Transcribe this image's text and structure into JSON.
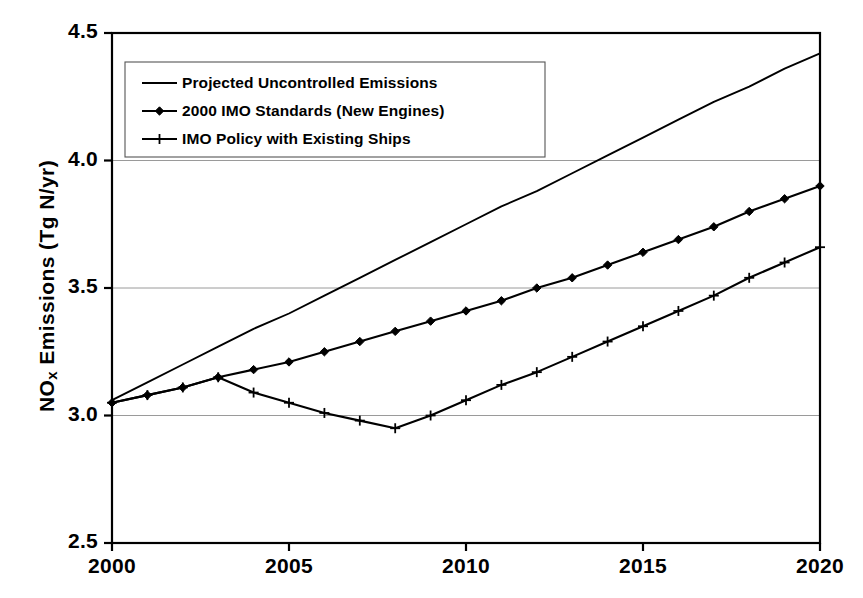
{
  "chart_data": {
    "type": "line",
    "title": "",
    "xlabel": "",
    "ylabel": "NOx Emissions (Tg N/yr)",
    "ylabel_main": "NO",
    "ylabel_sub": "x",
    "ylabel_rest": " Emissions (Tg N/yr)",
    "xlim": [
      2000,
      2020
    ],
    "ylim": [
      2.5,
      4.5
    ],
    "grid": true,
    "grid_axis": "y",
    "legend_position": "top-left-inside",
    "xticks": [
      "2000",
      "2005",
      "2010",
      "2015",
      "2020"
    ],
    "xtick_values": [
      2000,
      2005,
      2010,
      2015,
      2020
    ],
    "yticks": [
      "2.5",
      "3.0",
      "3.5",
      "4.0",
      "4.5"
    ],
    "ytick_values": [
      2.5,
      3.0,
      3.5,
      4.0,
      4.5
    ],
    "x": [
      2000,
      2001,
      2002,
      2003,
      2004,
      2005,
      2006,
      2007,
      2008,
      2009,
      2010,
      2011,
      2012,
      2013,
      2014,
      2015,
      2016,
      2017,
      2018,
      2019,
      2020
    ],
    "series": [
      {
        "name": "Projected Uncontrolled Emissions",
        "marker": "none",
        "color": "#000000",
        "values": [
          3.06,
          3.13,
          3.2,
          3.27,
          3.34,
          3.4,
          3.47,
          3.54,
          3.61,
          3.68,
          3.75,
          3.82,
          3.88,
          3.95,
          4.02,
          4.09,
          4.16,
          4.23,
          4.29,
          4.36,
          4.42
        ]
      },
      {
        "name": "2000 IMO Standards (New Engines)",
        "marker": "diamond",
        "color": "#000000",
        "values": [
          3.05,
          3.08,
          3.11,
          3.15,
          3.18,
          3.21,
          3.25,
          3.29,
          3.33,
          3.37,
          3.41,
          3.45,
          3.5,
          3.54,
          3.59,
          3.64,
          3.69,
          3.74,
          3.8,
          3.85,
          3.9
        ]
      },
      {
        "name": "IMO Policy with Existing Ships",
        "marker": "plus",
        "color": "#000000",
        "values": [
          3.05,
          3.08,
          3.11,
          3.15,
          3.09,
          3.05,
          3.01,
          2.98,
          2.95,
          3.0,
          3.06,
          3.12,
          3.17,
          3.23,
          3.29,
          3.35,
          3.41,
          3.47,
          3.54,
          3.6,
          3.66
        ]
      }
    ]
  },
  "legend": {
    "items": [
      {
        "label": "Projected Uncontrolled Emissions",
        "marker": "none"
      },
      {
        "label": "2000 IMO Standards (New Engines)",
        "marker": "diamond"
      },
      {
        "label": "IMO Policy with Existing Ships",
        "marker": "plus"
      }
    ]
  },
  "colors": {
    "line": "#000000",
    "axis": "#000000",
    "grid": "#9a9a9a",
    "background": "#ffffff"
  }
}
